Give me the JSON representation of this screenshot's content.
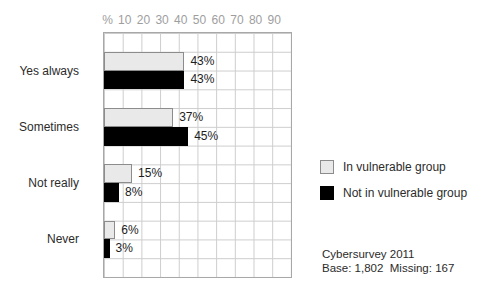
{
  "chart_data": {
    "type": "bar",
    "orientation": "horizontal",
    "title": "",
    "categories": [
      "Yes always",
      "Sometimes",
      "Not really",
      "Never"
    ],
    "series": [
      {
        "name": "In vulnerable group",
        "fill": "#e9e9e9",
        "border": "#8c8c8c",
        "values": [
          43,
          37,
          15,
          6
        ]
      },
      {
        "name": "Not in vulnerable group",
        "fill": "#000000",
        "border": "#000000",
        "values": [
          43,
          45,
          8,
          3
        ]
      }
    ],
    "value_suffix": "%",
    "data_labels": [
      "43%",
      "43%",
      "37%",
      "45%",
      "15%",
      "8%",
      "6%",
      "3%"
    ],
    "axis": {
      "position": "top",
      "unit_label": "%",
      "ticks": [
        "10",
        "20",
        "30",
        "40",
        "50",
        "60",
        "70",
        "80",
        "90"
      ],
      "min": 0,
      "max": 100,
      "grid": true
    },
    "legend_position": "right",
    "annotations": {
      "source_line1": "Cybersurvey 2011",
      "source_line2": "Base: 1,802  Missing: 167"
    }
  },
  "colors": {
    "background": "#ffffff",
    "plot_border": "#a8a8a8",
    "grid_line": "#cdcdcd",
    "axis_tick_text": "#9e9e9e",
    "category_text": "#2b2b2b",
    "value_label_text": "#1d1d1d",
    "vulnerable_bar_fill": "#e9e9e9",
    "vulnerable_bar_border": "#8c8c8c",
    "not_vulnerable_bar_fill": "#000000"
  }
}
